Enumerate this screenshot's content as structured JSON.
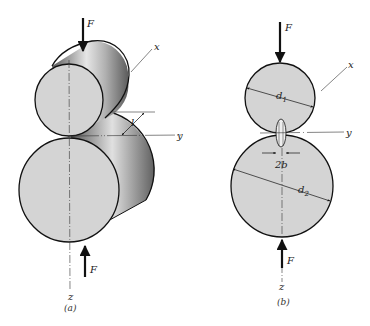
{
  "figure": {
    "panel_a": {
      "caption": "(a)",
      "labels": {
        "force_top": "F",
        "force_bottom": "F",
        "axis_x": "x",
        "axis_y": "y",
        "axis_z": "z",
        "length": "l"
      }
    },
    "panel_b": {
      "caption": "(b)",
      "labels": {
        "force_top": "F",
        "force_bottom": "F",
        "axis_x": "x",
        "axis_y": "y",
        "axis_z": "z",
        "diameter_1": "d",
        "diameter_1_sub": "1",
        "diameter_2": "d",
        "diameter_2_sub": "2",
        "contact_width": "2b"
      }
    },
    "colors": {
      "face_fill": "#d4d4d4",
      "outline": "#111111",
      "background": "#ffffff"
    }
  }
}
